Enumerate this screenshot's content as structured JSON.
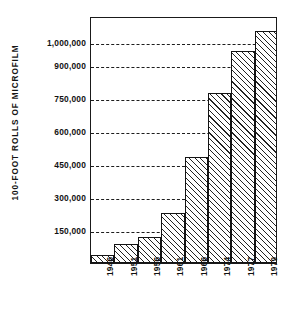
{
  "chart_data": {
    "type": "bar",
    "title": "",
    "subtitle": "",
    "xlabel": "",
    "ylabel": "100-FOOT ROLLS OF MICROFILM",
    "categories": [
      "1946",
      "1951",
      "1956",
      "1961",
      "1966",
      "1974",
      "1977",
      "1979"
    ],
    "values": [
      35000,
      85000,
      120000,
      225000,
      480000,
      770000,
      960000,
      1050000
    ],
    "series": [
      {
        "name": "100-foot rolls of microfilm",
        "values": [
          35000,
          85000,
          120000,
          225000,
          480000,
          770000,
          960000,
          1050000
        ]
      }
    ],
    "ytick_labels": [
      "150,000",
      "300,000",
      "450,000",
      "600,000",
      "750,000",
      "900,000",
      "1,000,000"
    ],
    "ytick_values": [
      150000,
      300000,
      450000,
      600000,
      750000,
      900000,
      1000000
    ],
    "ylim": [
      0,
      1120000
    ],
    "grid": "horizontal-dashed",
    "legend": "none",
    "bar_fill": "diagonal-hatch",
    "colors": {
      "axis": "#1a1a1a",
      "grid": "#1d1d1d",
      "bar_edge": "#131313",
      "hatch": "#222222",
      "background": "#ffffff",
      "text": "#121212"
    }
  },
  "axis": {
    "y_title": "100-FOOT ROLLS OF MICROFILM",
    "y_ticks": [
      {
        "label": "1,000,000",
        "value": 1000000
      },
      {
        "label": "900,000",
        "value": 900000
      },
      {
        "label": "750,000",
        "value": 750000
      },
      {
        "label": "600,000",
        "value": 600000
      },
      {
        "label": "450,000",
        "value": 450000
      },
      {
        "label": "300,000",
        "value": 300000
      },
      {
        "label": "150,000",
        "value": 150000
      }
    ],
    "x_ticks": [
      {
        "label": "1946"
      },
      {
        "label": "1951"
      },
      {
        "label": "1956"
      },
      {
        "label": "1961"
      },
      {
        "label": "1966"
      },
      {
        "label": "1974"
      },
      {
        "label": "1977"
      },
      {
        "label": "1979"
      }
    ]
  }
}
